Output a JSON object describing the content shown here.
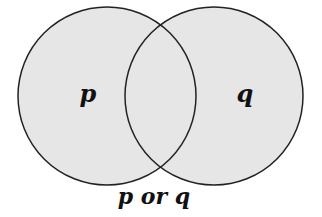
{
  "diagram": {
    "type": "venn",
    "sets": [
      {
        "label": "p",
        "cx": 107,
        "cy": 96,
        "r": 89
      },
      {
        "label": "q",
        "cx": 214,
        "cy": 96,
        "r": 89
      }
    ],
    "caption": "p or q",
    "colors": {
      "fill": "#e6e6e6",
      "stroke": "#222222",
      "text": "#111111"
    }
  }
}
